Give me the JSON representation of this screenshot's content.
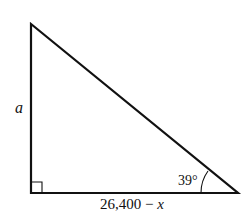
{
  "diagram": {
    "type": "right-triangle",
    "vertices": {
      "top": [
        31,
        24
      ],
      "right_angle": [
        31,
        193
      ],
      "acute": [
        238,
        193
      ]
    },
    "labels": {
      "vertical_side": "a",
      "angle": "39°",
      "base_number": "26,400",
      "base_minus": " − ",
      "base_var": "x"
    },
    "colors": {
      "stroke": "#111111",
      "background": "#ffffff"
    }
  }
}
